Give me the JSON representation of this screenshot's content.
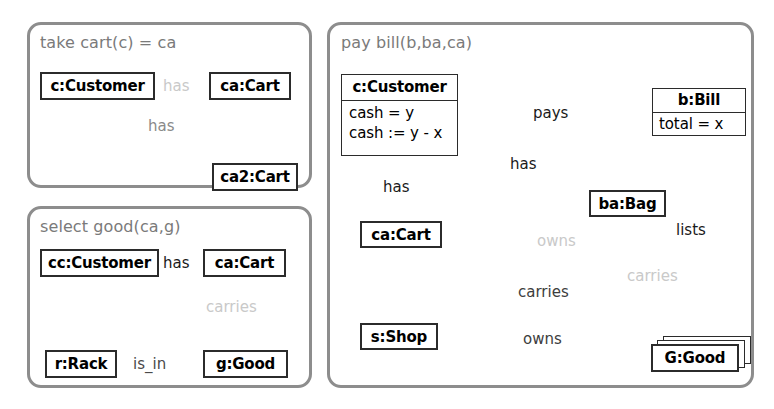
{
  "diagram": {
    "type": "uml-object-diagram-rule-set",
    "colors": {
      "panel_border": "#8d8d8d",
      "box_border": "#2b2b2b",
      "text": "#000000",
      "title_text": "#7a7a7a",
      "ghost_edge": "#c9c9c9",
      "solid_edge": "#3a3a3a",
      "dashed_edge": "#8a8a8a",
      "background": "#ffffff"
    }
  },
  "panels": [
    {
      "id": "take-cart",
      "title": "take cart(c) = ca",
      "objects": [
        {
          "id": "c-customer",
          "label": "c:Customer"
        },
        {
          "id": "ca-cart",
          "label": "ca:Cart"
        },
        {
          "id": "ca2-cart",
          "label": "ca2:Cart"
        }
      ],
      "edges": [
        {
          "id": "has-deleted",
          "label": "has",
          "from": "c-customer",
          "to": "ca-cart",
          "style": "dotted-ghost",
          "arrow": true
        },
        {
          "id": "has-created",
          "label": "has",
          "from": "c-customer",
          "to": "ca2-cart",
          "style": "solid-gray",
          "arrow": true,
          "crossed": true
        }
      ]
    },
    {
      "id": "select-good",
      "title": "select good(ca,g)",
      "objects": [
        {
          "id": "cc-customer",
          "label": "cc:Customer"
        },
        {
          "id": "ca-cart",
          "label": "ca:Cart"
        },
        {
          "id": "r-rack",
          "label": "r:Rack"
        },
        {
          "id": "g-good",
          "label": "g:Good"
        }
      ],
      "edges": [
        {
          "id": "has",
          "label": "has",
          "from": "cc-customer",
          "to": "ca-cart",
          "style": "solid",
          "arrow": true
        },
        {
          "id": "carries",
          "label": "carries",
          "from": "ca-cart",
          "to": "g-good",
          "style": "dotted-ghost",
          "arrow": true
        },
        {
          "id": "is-in",
          "label": "is_in",
          "from": "g-good",
          "to": "r-rack",
          "style": "dashed",
          "arrow": true
        }
      ]
    },
    {
      "id": "pay-bill",
      "title": "pay bill(b,ba,ca)",
      "objects": [
        {
          "id": "c-customer",
          "label": "c:Customer",
          "attributes": [
            "cash = y",
            "cash := y - x"
          ]
        },
        {
          "id": "b-bill",
          "label": "b:Bill",
          "attributes": [
            "total = x"
          ]
        },
        {
          "id": "ba-bag",
          "label": "ba:Bag"
        },
        {
          "id": "ca-cart",
          "label": "ca:Cart"
        },
        {
          "id": "s-shop",
          "label": "s:Shop"
        },
        {
          "id": "G-good",
          "label": "G:Good",
          "stacked": true
        }
      ],
      "edges": [
        {
          "id": "pays",
          "label": "pays",
          "from": "c-customer",
          "to": "b-bill",
          "style": "solid",
          "arrow": true
        },
        {
          "id": "has-bag",
          "label": "has",
          "from": "c-customer",
          "to": "ba-bag",
          "style": "solid",
          "arrow": true
        },
        {
          "id": "has-cart",
          "label": "has",
          "from": "c-customer",
          "to": "ca-cart",
          "style": "solid",
          "arrow": true
        },
        {
          "id": "lists",
          "label": "lists",
          "from": "b-bill",
          "to": "G-good",
          "style": "solid",
          "arrow": true
        },
        {
          "id": "owns-ghost",
          "label": "owns",
          "from": "c-customer",
          "to": "G-good",
          "style": "dotted-ghost",
          "arrow": true
        },
        {
          "id": "carries-ghost",
          "label": "carries",
          "from": "ba-bag",
          "to": "G-good",
          "style": "dotted-ghost",
          "arrow": true
        },
        {
          "id": "carries",
          "label": "carries",
          "from": "ca-cart",
          "to": "G-good",
          "style": "dashed",
          "arrow": true
        },
        {
          "id": "owns",
          "label": "owns",
          "from": "s-shop",
          "to": "G-good",
          "style": "dashed",
          "arrow": true
        }
      ]
    }
  ]
}
